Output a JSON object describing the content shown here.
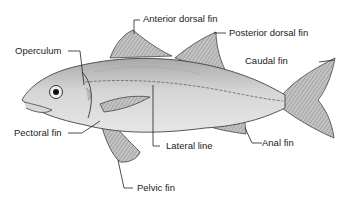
{
  "diagram": {
    "labels": {
      "anterior_dorsal_fin": "Anterior dorsal fin",
      "posterior_dorsal_fin": "Posterior dorsal fin",
      "operculum": "Operculum",
      "caudal_fin": "Caudal fin",
      "pectoral_fin": "Pectoral fin",
      "lateral_line": "Lateral line",
      "anal_fin": "Anal fin",
      "pelvic_fin": "Pelvic fin"
    },
    "colors": {
      "body": "#c9c9c9",
      "fin": "#b5b5b5",
      "line": "#333333",
      "text": "#222222"
    }
  }
}
